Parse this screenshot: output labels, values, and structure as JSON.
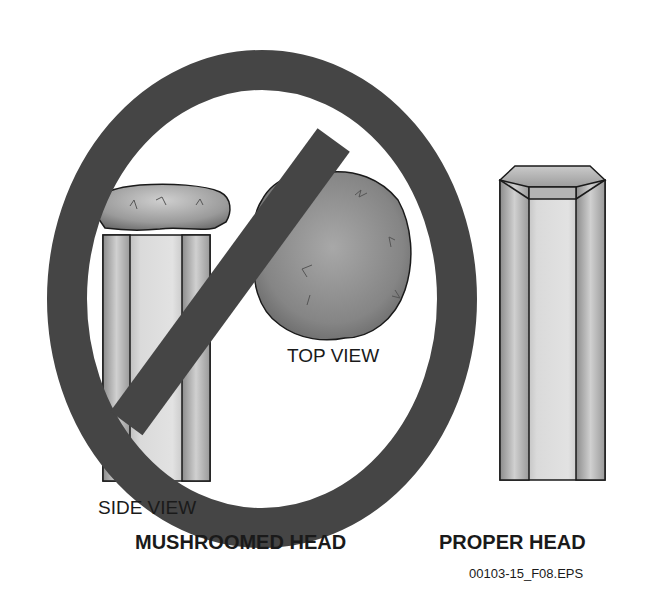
{
  "figure": {
    "mushroomed": {
      "side_view_label": "SIDE VIEW",
      "top_view_label": "TOP VIEW",
      "caption": "MUSHROOMED HEAD",
      "prohibition_symbol": "no-sign-icon"
    },
    "proper": {
      "caption": "PROPER HEAD"
    },
    "figure_id": "00103-15_F08.EPS"
  },
  "colors": {
    "background": "#ffffff",
    "prohibition_ring": "#454545",
    "outline": "#1a1a1a",
    "metal_light": "#d8d8d8",
    "metal_dark": "#8a8a8a",
    "top_view_fill": "#7a7a7a"
  }
}
